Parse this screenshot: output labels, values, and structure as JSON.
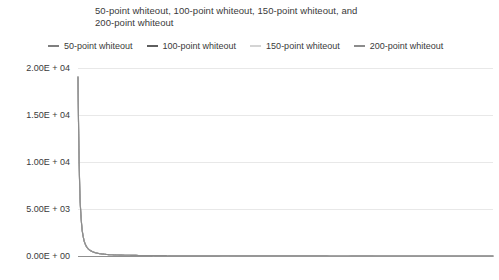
{
  "chart_data": {
    "type": "line",
    "title": "50-point whiteout, 100-point whiteout, 150-point whiteout, and 200-point whiteout",
    "title_line1": "50-point whiteout, 100-point whiteout, 150-point whiteout, and",
    "title_line2": "200-point whiteout",
    "xlabel": "",
    "ylabel": "",
    "grid": true,
    "legend_position": "top",
    "ylim": [
      0,
      20000
    ],
    "xlim": [
      0,
      200
    ],
    "ytick_labels": [
      "2.00E + 04",
      "1.50E + 04",
      "1.00E + 04",
      "5.00E + 03",
      "0.00E + 00"
    ],
    "ytick_values": [
      20000,
      15000,
      10000,
      5000,
      0
    ],
    "xtick_labels": [],
    "series": [
      {
        "name": "50-point whiteout",
        "color": "#7f7f7f",
        "x": [
          0,
          1,
          2,
          3,
          4,
          5,
          6,
          8,
          10,
          14,
          20,
          30,
          45,
          65,
          90,
          120,
          155,
          200
        ],
        "values": [
          19100,
          6100,
          2800,
          1600,
          1050,
          760,
          580,
          380,
          270,
          160,
          100,
          58,
          35,
          22,
          15,
          10,
          7,
          5
        ]
      },
      {
        "name": "100-point whiteout",
        "color": "#5e5e5e",
        "x": [
          0,
          1,
          2,
          3,
          4,
          5,
          6,
          8,
          10,
          14,
          20,
          30,
          45,
          65,
          90,
          120,
          155,
          200
        ],
        "values": [
          19000,
          6000,
          2750,
          1570,
          1030,
          745,
          570,
          372,
          265,
          157,
          98,
          57,
          34,
          21,
          14,
          9,
          6,
          4
        ]
      },
      {
        "name": "150-point whiteout",
        "color": "#d4d4d4",
        "x": [
          0,
          1,
          2,
          3,
          4,
          5,
          6,
          8,
          10,
          14,
          20,
          30,
          45,
          65,
          90,
          120,
          155,
          200
        ],
        "values": [
          18950,
          5960,
          2730,
          1555,
          1020,
          738,
          565,
          368,
          262,
          155,
          97,
          56,
          33,
          20,
          13,
          9,
          6,
          4
        ]
      },
      {
        "name": "200-point whiteout",
        "color": "#8c8c8c",
        "x": [
          0,
          1,
          2,
          3,
          4,
          5,
          6,
          8,
          10,
          14,
          20,
          30,
          45,
          65,
          90,
          120,
          155,
          200
        ],
        "values": [
          18900,
          5930,
          2715,
          1545,
          1012,
          732,
          560,
          365,
          259,
          153,
          96,
          55,
          32,
          20,
          13,
          8,
          6,
          4
        ]
      }
    ]
  },
  "legend": {
    "items": [
      {
        "label": "50-point whiteout",
        "color": "#7f7f7f"
      },
      {
        "label": "100-point whiteout",
        "color": "#5e5e5e"
      },
      {
        "label": "150-point whiteout",
        "color": "#d4d4d4"
      },
      {
        "label": "200-point whiteout",
        "color": "#8c8c8c"
      }
    ]
  },
  "axis": {
    "y_labels": [
      "2.00E + 04",
      "1.50E + 04",
      "1.00E + 04",
      "5.00E + 03",
      "0.00E + 00"
    ]
  },
  "colors": {
    "gridline": "#e8e8e8",
    "axis": "#8f8f8f",
    "text": "#3a3a3a",
    "background": "#ffffff"
  }
}
